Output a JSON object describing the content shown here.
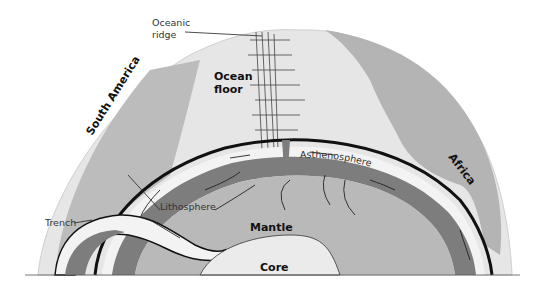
{
  "diagram": {
    "type": "earth cross-section (plate tectonics)",
    "colors": {
      "surface": "#e8e8e8",
      "continent": "#bdbdbd",
      "lithosphere_band": "#f2f2f2",
      "asthenosphere": "#7f7f7f",
      "mantle": "#b8b8b8",
      "core": "#ebebeb",
      "lines": "#111111"
    },
    "labels": {
      "oceanic_ridge_line1": "Oceanic",
      "oceanic_ridge_line2": "ridge",
      "ocean_floor_line1": "Ocean",
      "ocean_floor_line2": "floor",
      "south_america": "South America",
      "africa": "Africa",
      "asthenosphere": "Asthenosphere",
      "lithosphere": "Lithosphere",
      "trench": "Trench",
      "mantle": "Mantle",
      "core": "Core"
    }
  }
}
